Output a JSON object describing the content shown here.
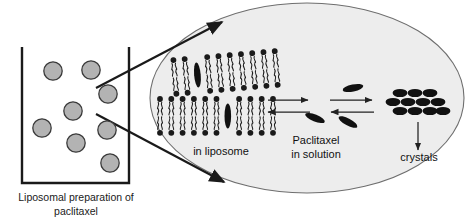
{
  "figure": {
    "title_caption": {
      "line1": "Liposomal preparation of",
      "line2": "paclitaxel"
    },
    "labels": {
      "in_liposome": "in liposome",
      "in_solution_line1": "Paclitaxel",
      "in_solution_line2": "in solution",
      "crystals": "crystals"
    }
  },
  "colors": {
    "background": "#ffffff",
    "stroke": "#1a1a1a",
    "vesicle_fill": "#b3b3b3",
    "vesicle_stroke": "#3a3a3a",
    "magnifier_fill": "#ededed",
    "magnifier_stroke": "#6e6e6e",
    "drug_fill": "#111111",
    "lipid_fill": "#1a1a1a",
    "arrow_stroke": "#222222",
    "text": "#111111"
  },
  "beaker": {
    "x": 22,
    "y": 47,
    "width": 107,
    "height": 136,
    "stroke_width": 2.4,
    "vesicle_radius": 9.2,
    "vesicles": [
      {
        "cx": 53,
        "cy": 71
      },
      {
        "cx": 91,
        "cy": 70
      },
      {
        "cx": 108,
        "cy": 94
      },
      {
        "cx": 73,
        "cy": 111
      },
      {
        "cx": 42,
        "cy": 128
      },
      {
        "cx": 107,
        "cy": 130
      },
      {
        "cx": 76,
        "cy": 143
      },
      {
        "cx": 110,
        "cy": 163
      },
      {
        "cx": 53,
        "cy": 71
      }
    ]
  },
  "magnifier": {
    "cx": 307,
    "cy": 98,
    "rx": 157,
    "ry": 95,
    "stroke_width": 1.1
  },
  "connectors": [
    {
      "x1": 96,
      "y1": 88,
      "x2": 222,
      "y2": 22,
      "name": "upper-connector"
    },
    {
      "x1": 96,
      "y1": 114,
      "x2": 224,
      "y2": 182,
      "name": "lower-connector"
    }
  ],
  "bilayers": [
    {
      "name": "upper-bilayer",
      "x": 175,
      "y": 60,
      "units": 10,
      "spacing": 11.3,
      "rotate": -5,
      "drug_index": 2
    },
    {
      "name": "lower-bilayer",
      "x": 160,
      "y": 99,
      "units": 11,
      "spacing": 11.3,
      "rotate": 0,
      "drug_index": 6
    }
  ],
  "reaction_arrows": [
    {
      "name": "forward-arrow-1",
      "x1": 268,
      "y1": 100,
      "x2": 308,
      "y2": 100,
      "dir": "right"
    },
    {
      "name": "reverse-arrow-1",
      "x1": 310,
      "y1": 112,
      "x2": 268,
      "y2": 112,
      "dir": "left"
    },
    {
      "name": "forward-arrow-2",
      "x1": 330,
      "y1": 100,
      "x2": 372,
      "y2": 100,
      "dir": "right"
    },
    {
      "name": "reverse-arrow-2",
      "x1": 374,
      "y1": 112,
      "x2": 331,
      "y2": 112,
      "dir": "left"
    }
  ],
  "free_drugs": [
    {
      "cx": 353,
      "cy": 88,
      "rotate": -12
    },
    {
      "cx": 315,
      "cy": 118,
      "rotate": 22
    },
    {
      "cx": 348,
      "cy": 122,
      "rotate": 28
    }
  ],
  "crystal_cluster": {
    "rows": [
      {
        "y": 93,
        "xs": [
          400,
          415,
          430
        ]
      },
      {
        "y": 102,
        "xs": [
          393,
          408,
          423,
          438
        ]
      },
      {
        "y": 111,
        "xs": [
          400,
          415,
          430,
          443
        ]
      }
    ],
    "rx": 7.4,
    "ry": 4.1,
    "arrow": {
      "x1": 418,
      "y1": 122,
      "x2": 418,
      "y2": 150
    }
  },
  "label_positions": {
    "in_liposome": {
      "x": 221,
      "y": 152
    },
    "in_solution1": {
      "x": 316,
      "y": 141
    },
    "in_solution2": {
      "x": 316,
      "y": 155
    },
    "crystals": {
      "x": 419,
      "y": 158
    },
    "caption1": {
      "x": 76,
      "y": 198
    },
    "caption2": {
      "x": 76,
      "y": 212
    }
  }
}
